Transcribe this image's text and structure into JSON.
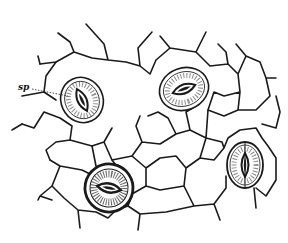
{
  "figure": {
    "background": "#ffffff",
    "ink": "#1a1a1a",
    "labels": [
      {
        "text": "sp",
        "x": 18,
        "y": 84
      }
    ],
    "stomata": [
      {
        "id": 1,
        "cx": 82,
        "cy": 100,
        "rx": 20,
        "ry": 22,
        "rotate": -25,
        "shade": "light"
      },
      {
        "id": 2,
        "cx": 184,
        "cy": 89,
        "rx": 24,
        "ry": 21,
        "rotate": 20,
        "shade": "light"
      },
      {
        "id": 3,
        "cx": 109,
        "cy": 188,
        "rx": 22,
        "ry": 24,
        "rotate": -10,
        "shade": "dark"
      },
      {
        "id": 4,
        "cx": 245,
        "cy": 165,
        "rx": 18,
        "ry": 23,
        "rotate": 0,
        "shade": "light"
      }
    ]
  }
}
